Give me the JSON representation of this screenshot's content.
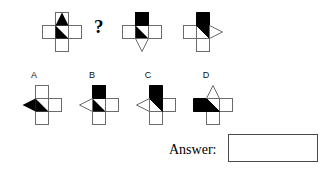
{
  "puzzle": {
    "type": "visual-analogy-matrix",
    "background_color": "#ffffff",
    "stroke_color": "#6b6b6b",
    "fill_black": "#000000",
    "fill_white": "#ffffff",
    "question_mark": "?",
    "sequence": {
      "label": "top-row-sequence",
      "items": [
        {
          "id": "seq-1",
          "position": 1,
          "description": "cross with black up-pointing triangle on top arm and black right-triangle in center",
          "missing": false
        },
        {
          "id": "seq-missing",
          "position": 2,
          "description": "missing figure indicated by question mark",
          "missing": true
        },
        {
          "id": "seq-3",
          "position": 3,
          "description": "cross with solid black top arm, black triangle in center and white down triangle on bottom arm",
          "missing": false
        },
        {
          "id": "seq-4",
          "position": 4,
          "description": "cross with black top arm extending into center and white right-pointing triangle on right arm",
          "missing": false
        }
      ]
    },
    "options": {
      "label": "answer-options",
      "items": [
        {
          "id": "option-a",
          "letter": "A",
          "description": "cross with black left-pointing triangle on left arm and black triangle in center"
        },
        {
          "id": "option-b",
          "letter": "B",
          "description": "cross with solid black top arm, black triangle in center and white left triangle on left arm"
        },
        {
          "id": "option-c",
          "letter": "C",
          "description": "cross with black top arm into center and white left-pointing triangle on left arm"
        },
        {
          "id": "option-d",
          "letter": "D",
          "description": "cross with black left arm into center and white up-pointing triangle on top arm"
        }
      ]
    },
    "answer": {
      "label": "Answer:",
      "value": "",
      "placeholder": ""
    }
  }
}
